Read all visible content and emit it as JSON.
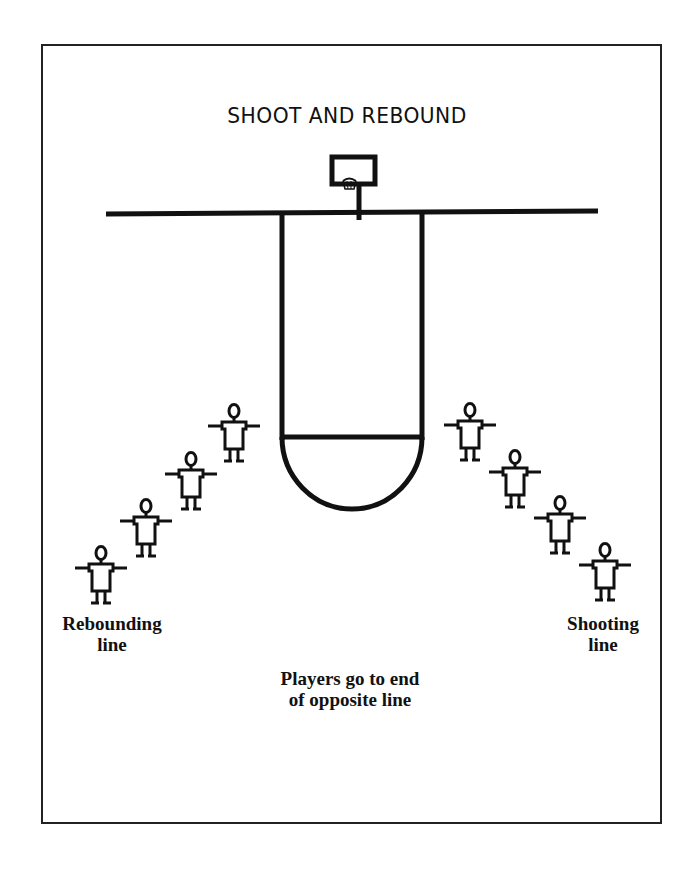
{
  "diagram": {
    "title": "SHOOT AND REBOUND",
    "labels": {
      "rebounding_line": "Rebounding line",
      "rebounding_line_1": "Rebounding",
      "rebounding_line_2": "line",
      "shooting_line_1": "Shooting",
      "shooting_line_2": "line",
      "note_1": "Players go to end",
      "note_2": "of opposite line"
    },
    "elements": {
      "court": [
        "baseline",
        "basket",
        "backboard",
        "free-throw lane",
        "free-throw circle"
      ],
      "rebounding_line_players": 4,
      "shooting_line_players": 4
    },
    "colors": {
      "ink": "#111111",
      "background": "#ffffff"
    }
  }
}
